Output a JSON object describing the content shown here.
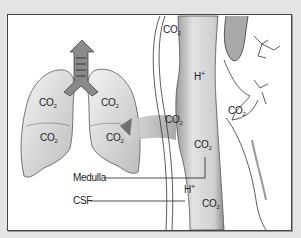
{
  "figure": {
    "labels": {
      "lung_left_upper": {
        "base": "CO",
        "sub": "2"
      },
      "lung_right_upper": {
        "base": "CO",
        "sub": "2"
      },
      "lung_left_lower": {
        "base": "CO",
        "sub": "2"
      },
      "lung_right_lower": {
        "base": "CO",
        "sub": "2"
      },
      "vessel_top": {
        "base": "CO",
        "sub": "2"
      },
      "medulla_h": {
        "base": "H",
        "sup": "+"
      },
      "vessel_mid": {
        "base": "CO",
        "sub": "2"
      },
      "right_co2": {
        "base": "CO",
        "sub": "2"
      },
      "medulla_co2": {
        "base": "CO",
        "sub": "2"
      },
      "csf_h": {
        "base": "H",
        "sup": "+"
      },
      "csf_co2": {
        "base": "CO",
        "sub": "2"
      }
    },
    "callouts": {
      "medulla": "Medulla",
      "csf": "CSF"
    },
    "colors": {
      "frame": "#e4e4e4",
      "panel": "#ffffff",
      "border": "#444444",
      "tissue_shade": "#bdbdbd",
      "line": "#222222"
    }
  }
}
